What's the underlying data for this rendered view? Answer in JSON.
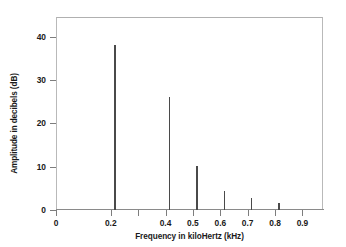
{
  "chart_data": {
    "type": "bar",
    "title": "",
    "subtitle": "",
    "xlabel": "Frequency in kiloHertz (kHz)",
    "ylabel": "Amplitude in decibels (dB)",
    "xlim": [
      0,
      0.975
    ],
    "ylim": [
      0,
      44.5
    ],
    "grid": false,
    "legend": null,
    "series_style": "impulse-spikes",
    "x": [
      0.215,
      0.415,
      0.515,
      0.615,
      0.715,
      0.815
    ],
    "values": [
      38.1,
      26.1,
      10.2,
      4.4,
      2.8,
      1.6
    ],
    "categories": [
      "0.215",
      "0.415",
      "0.515",
      "0.615",
      "0.715",
      "0.815"
    ],
    "xticks": [
      {
        "value": 0,
        "label": "0"
      },
      {
        "value": 0.2,
        "label": "0.2"
      },
      {
        "value": 0.3,
        "label": ""
      },
      {
        "value": 0.4,
        "label": "0.4"
      },
      {
        "value": 0.5,
        "label": "0.5"
      },
      {
        "value": 0.6,
        "label": "0.6"
      },
      {
        "value": 0.7,
        "label": "0.7"
      },
      {
        "value": 0.8,
        "label": "0.8"
      },
      {
        "value": 0.9,
        "label": "0.9"
      }
    ],
    "yticks": [
      {
        "value": 0,
        "label": "0"
      },
      {
        "value": 10,
        "label": "10"
      },
      {
        "value": 20,
        "label": "20"
      },
      {
        "value": 30,
        "label": "30"
      },
      {
        "value": 40,
        "label": "40"
      }
    ],
    "colors": {
      "background": "#ffffff",
      "spike": "#4a4a4a",
      "frame": "#b9b9b9",
      "axis": "#8a8a8a",
      "text": "#1a1a1a"
    }
  }
}
